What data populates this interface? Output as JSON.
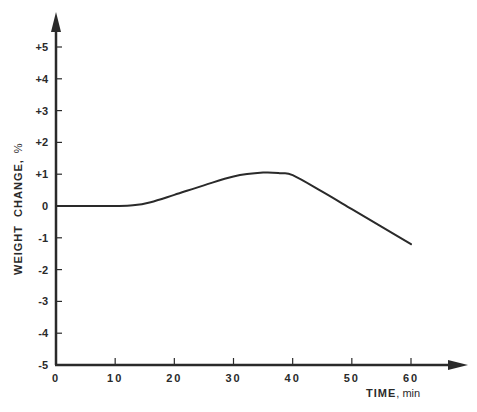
{
  "chart_data": {
    "type": "line",
    "title": "",
    "xlabel": "TIME",
    "xlabel_unit": "min",
    "ylabel": "WEIGHT CHANGE",
    "ylabel_unit": "%",
    "xlim": [
      0,
      65
    ],
    "ylim": [
      -5,
      5.6
    ],
    "grid": false,
    "legend": null,
    "x_ticks": [
      "0",
      "10",
      "20",
      "30",
      "40",
      "50",
      "60"
    ],
    "y_ticks": [
      "+5",
      "+4",
      "+3",
      "+2",
      "+1",
      "0",
      "-1",
      "-2",
      "-3",
      "-4",
      "-5"
    ],
    "series": [
      {
        "name": "weight change",
        "x": [
          0,
          5,
          10,
          13,
          16,
          20,
          25,
          30,
          35,
          38,
          40,
          45,
          50,
          55,
          60
        ],
        "values": [
          0,
          0,
          0,
          0.02,
          0.12,
          0.35,
          0.65,
          0.93,
          1.05,
          1.03,
          0.97,
          0.45,
          -0.1,
          -0.65,
          -1.2
        ]
      }
    ]
  },
  "axes": {
    "x_title": "TIME",
    "x_unit": ", min",
    "y_title": "WEIGHT  CHANGE,",
    "y_unit": "%"
  },
  "colors": {
    "ink": "#2a2a2a",
    "background": "#ffffff"
  }
}
